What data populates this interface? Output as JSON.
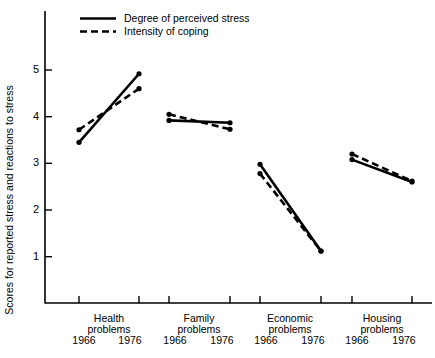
{
  "chart_data": {
    "type": "line",
    "title": "",
    "xlabel": "",
    "ylabel": "Scores for reported stress and reactions to stress",
    "ylim": [
      0.3,
      5.6
    ],
    "yticks": [
      1,
      2,
      3,
      4,
      5
    ],
    "ytick_labels": [
      "1",
      "2",
      "3",
      "4",
      "5"
    ],
    "grid": false,
    "legend_position": "top-left",
    "x_years": [
      "1966",
      "1976"
    ],
    "groups": [
      "Health problems",
      "Family problems",
      "Economic problems",
      "Housing problems"
    ],
    "group_lines": [
      {
        "line1": "Health",
        "line2": "problems"
      },
      {
        "line1": "Family",
        "line2": "problems"
      },
      {
        "line1": "Economic",
        "line2": "problems"
      },
      {
        "line1": "Housing",
        "line2": "problems"
      }
    ],
    "series": [
      {
        "name": "Degree of perceived stress",
        "style": "solid",
        "points": [
          {
            "group": "Health problems",
            "year": "1966",
            "value": 3.45
          },
          {
            "group": "Health problems",
            "year": "1976",
            "value": 4.92
          },
          {
            "group": "Family problems",
            "year": "1966",
            "value": 3.92
          },
          {
            "group": "Family problems",
            "year": "1976",
            "value": 3.87
          },
          {
            "group": "Economic problems",
            "year": "1966",
            "value": 2.98
          },
          {
            "group": "Economic problems",
            "year": "1976",
            "value": 1.12
          },
          {
            "group": "Housing problems",
            "year": "1966",
            "value": 3.08
          },
          {
            "group": "Housing problems",
            "year": "1976",
            "value": 2.6
          }
        ]
      },
      {
        "name": "Intensity of coping",
        "style": "dashed",
        "points": [
          {
            "group": "Health problems",
            "year": "1966",
            "value": 3.72
          },
          {
            "group": "Health problems",
            "year": "1976",
            "value": 4.6
          },
          {
            "group": "Family problems",
            "year": "1966",
            "value": 4.05
          },
          {
            "group": "Family problems",
            "year": "1976",
            "value": 3.73
          },
          {
            "group": "Economic problems",
            "year": "1966",
            "value": 2.78
          },
          {
            "group": "Economic problems",
            "year": "1976",
            "value": 1.12
          },
          {
            "group": "Housing problems",
            "year": "1966",
            "value": 3.2
          },
          {
            "group": "Housing problems",
            "year": "1976",
            "value": 2.62
          }
        ]
      }
    ],
    "colors": {
      "axis": "#000000",
      "series": "#000000",
      "background": "#ffffff"
    }
  },
  "legend": {
    "items": [
      {
        "label": "Degree of perceived stress",
        "style": "solid"
      },
      {
        "label": "Intensity of coping",
        "style": "dashed"
      }
    ]
  },
  "axis": {
    "y_title": "Scores for reported stress and reactions to stress"
  }
}
